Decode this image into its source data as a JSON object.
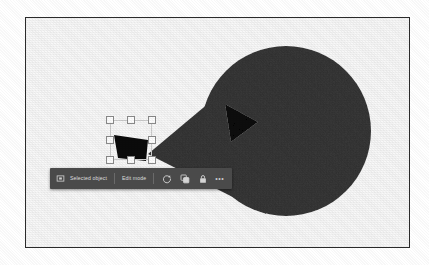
{
  "document": {
    "title": "Shape Editor Canvas",
    "background_color": "#ffffff",
    "canvas_background": "#f8f8f8",
    "frame_border_color": "#2b2b2b"
  },
  "shapes": {
    "primary": {
      "name": "funnel-circle-shape",
      "fill_color": "#3a3a3a",
      "circle_center_x": 260,
      "circle_center_y": 113,
      "circle_radius": 85,
      "tip_x": 122,
      "tip_y": 136
    },
    "triangle_inside": {
      "name": "play-triangle",
      "fill_color": "#0c0c0c"
    },
    "triangle_selected": {
      "name": "selected-triangle",
      "fill_color": "#0c0c0c"
    }
  },
  "selection": {
    "handle_count": 8,
    "handle_fill": "#ffffff",
    "handle_border": "#8c8c8c",
    "box_border": "#cfcfcf"
  },
  "toolbar": {
    "background_color": "#4a4a4a",
    "text_color": "#dcdcdc",
    "object_icon": "rectangle-select-icon",
    "object_label": "Selected object",
    "mode_label": "Edit mode",
    "buttons": [
      {
        "name": "rotate-icon",
        "label": "Rotate"
      },
      {
        "name": "duplicate-icon",
        "label": "Duplicate"
      },
      {
        "name": "lock-icon",
        "label": "Lock"
      }
    ],
    "more_label": "•••"
  }
}
